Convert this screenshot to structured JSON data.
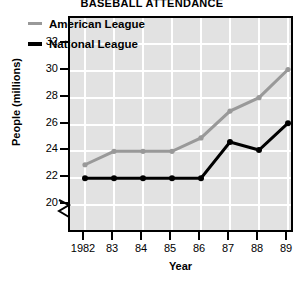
{
  "chart_data": {
    "type": "line",
    "title": "BASEBALL ATTENDANCE",
    "xlabel": "Year",
    "ylabel": "People (millions)",
    "categories": [
      "1982",
      "83",
      "84",
      "85",
      "86",
      "87",
      "88",
      "89"
    ],
    "x_tick_labels": [
      "1982",
      "83",
      "84",
      "85",
      "86",
      "87",
      "88",
      "89"
    ],
    "y_tick_labels": [
      "20",
      "22",
      "24",
      "26",
      "28",
      "30",
      "32"
    ],
    "ylim": [
      20,
      32
    ],
    "y_axis_break": true,
    "grid": true,
    "legend_position": "top-left",
    "series": [
      {
        "name": "American League",
        "color": "#999999",
        "values": [
          23.0,
          24.0,
          24.0,
          24.0,
          25.0,
          27.0,
          28.0,
          30.1
        ]
      },
      {
        "name": "National League",
        "color": "#000000",
        "values": [
          22.0,
          22.0,
          22.0,
          22.0,
          22.0,
          24.7,
          24.1,
          26.1
        ]
      }
    ]
  },
  "legend": {
    "items": [
      {
        "label": "American League",
        "color": "#999999"
      },
      {
        "label": "National League",
        "color": "#000000"
      }
    ]
  },
  "colors": {
    "plot_background": "#e2e2e2",
    "gridline": "#ffffff",
    "frame": "#000000",
    "american_league": "#999999",
    "national_league": "#000000"
  }
}
